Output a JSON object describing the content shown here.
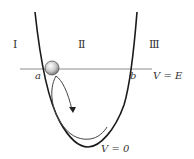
{
  "diagram": {
    "regions": [
      {
        "label": "I",
        "x": 15,
        "y": 48
      },
      {
        "label": "Ⅱ",
        "x": 81,
        "y": 48
      },
      {
        "label": "Ⅲ",
        "x": 153,
        "y": 48
      }
    ],
    "turning_points": {
      "a": "a",
      "b": "b"
    },
    "energy_line_label": "V = E",
    "ground_label": "V = 0",
    "colors": {
      "curve": "#1a1a1a",
      "energy_line": "#888888",
      "ball_light": "#ffffff",
      "ball_dark": "#8a8a8a",
      "path": "#444444"
    }
  }
}
